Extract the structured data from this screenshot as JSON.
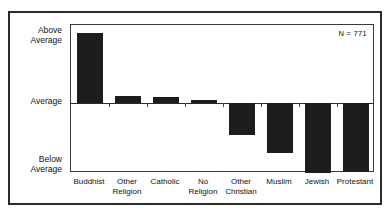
{
  "figure": {
    "title_cut_off": "",
    "annotation_n": "N = 771"
  },
  "axis": {
    "y_labels": {
      "above": "Above\nAverage",
      "average": "Average",
      "below": "Below\nAverage"
    }
  },
  "chart_data": {
    "type": "bar",
    "title": "",
    "subtitle": "",
    "xlabel": "",
    "ylabel": "",
    "categories": [
      "Buddhist",
      "Other\nReligion",
      "Catholic",
      "No Religion",
      "Other\nChristian",
      "Muslim",
      "Jewish",
      "Protestant"
    ],
    "values": [
      1.0,
      0.1,
      0.08,
      0.05,
      -0.45,
      -0.72,
      -1.0,
      -0.98
    ],
    "ylim": [
      -1.15,
      1.18
    ],
    "ytick_labels": [
      "Below Average",
      "Average",
      "Above Average"
    ],
    "ytick_values": [
      -1.0,
      0.0,
      1.0
    ],
    "grid": false,
    "legend": null,
    "bar_color": "#1d1d1d",
    "annotations": [
      "N = 771"
    ],
    "sample_size": 771
  }
}
